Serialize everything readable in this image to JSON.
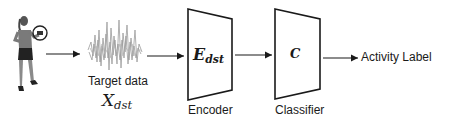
{
  "diagram": {
    "source": {
      "icon": "person-with-wrist-sensor-icon"
    },
    "target_data": {
      "icon": "sensor-signal-waveform-icon",
      "label": "Target data",
      "symbol_main": "X",
      "symbol_sub": "dst"
    },
    "encoder": {
      "symbol_main": "E",
      "symbol_sub": "dst",
      "label": "Encoder"
    },
    "classifier": {
      "symbol": "C",
      "label": "Classifier"
    },
    "output": {
      "label": "Activity Label"
    },
    "colors": {
      "stroke": "#1a1a1a",
      "waveform": "#9a9a9a",
      "figure": "#6b6b6b"
    }
  }
}
